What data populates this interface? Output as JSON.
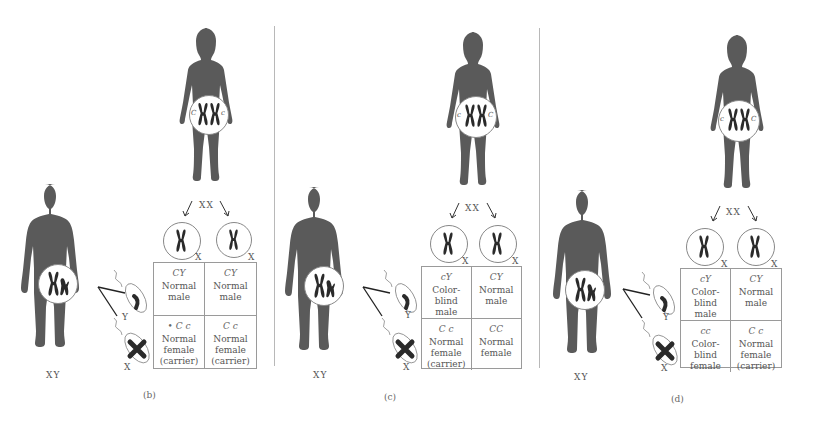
{
  "diagram": {
    "type": "X-linked inheritance of color blindness (Punnett squares)",
    "colors": {
      "silhouette": "#5a5a5a",
      "chromosome": "#2a2a2a",
      "line": "#9a9a9a",
      "text": "#555555"
    }
  },
  "panels": [
    {
      "id": "b",
      "label": "(b)",
      "mother": {
        "karyotype": "XX",
        "alleles": [
          "C",
          "c"
        ]
      },
      "father": {
        "karyotype": "XY",
        "allele": "c"
      },
      "eggs": [
        {
          "chromosome": "X",
          "allele": "C"
        },
        {
          "chromosome": "X",
          "allele": "c"
        }
      ],
      "sperm": [
        {
          "chromosome": "Y"
        },
        {
          "chromosome": "X",
          "allele": "c"
        }
      ],
      "cells": [
        {
          "genotype": "CY",
          "phenotype": [
            "Normal",
            "male"
          ]
        },
        {
          "genotype": "CY",
          "phenotype": [
            "Normal",
            "male"
          ]
        },
        {
          "genotype": "• C c",
          "phenotype": [
            "Normal",
            "female",
            "(carrier)"
          ]
        },
        {
          "genotype": "C c",
          "phenotype": [
            "Normal",
            "female",
            "(carrier)"
          ]
        }
      ]
    },
    {
      "id": "c",
      "label": "(c)",
      "mother": {
        "karyotype": "XX",
        "alleles": [
          "c",
          "C"
        ]
      },
      "father": {
        "karyotype": "XY",
        "allele": "C"
      },
      "eggs": [
        {
          "chromosome": "X",
          "allele": "c"
        },
        {
          "chromosome": "X",
          "allele": "C"
        }
      ],
      "sperm": [
        {
          "chromosome": "Y"
        },
        {
          "chromosome": "X",
          "allele": "C"
        }
      ],
      "cells": [
        {
          "genotype": "cY",
          "phenotype": [
            "Color-blind",
            "male"
          ]
        },
        {
          "genotype": "CY",
          "phenotype": [
            "Normal",
            "male"
          ]
        },
        {
          "genotype": "C c",
          "phenotype": [
            "Normal",
            "female",
            "(carrier)"
          ]
        },
        {
          "genotype": "CC",
          "phenotype": [
            "Normal",
            "female"
          ]
        }
      ]
    },
    {
      "id": "d",
      "label": "(d)",
      "mother": {
        "karyotype": "XX",
        "alleles": [
          "c",
          "C"
        ]
      },
      "father": {
        "karyotype": "XY",
        "allele": "c"
      },
      "eggs": [
        {
          "chromosome": "X",
          "allele": "c"
        },
        {
          "chromosome": "X",
          "allele": "C"
        }
      ],
      "sperm": [
        {
          "chromosome": "Y"
        },
        {
          "chromosome": "X",
          "allele": "c"
        }
      ],
      "cells": [
        {
          "genotype": "cY",
          "phenotype": [
            "Color-blind",
            "male"
          ]
        },
        {
          "genotype": "CY",
          "phenotype": [
            "Normal",
            "male"
          ]
        },
        {
          "genotype": "cc",
          "phenotype": [
            "Color-blind",
            "female"
          ]
        },
        {
          "genotype": "C c",
          "phenotype": [
            "Normal",
            "female",
            "(carrier)"
          ]
        }
      ]
    }
  ],
  "labels": {
    "female_karyotype": "XX",
    "male_karyotype": "XY",
    "x_chrom": "X",
    "y_chrom": "Y"
  }
}
